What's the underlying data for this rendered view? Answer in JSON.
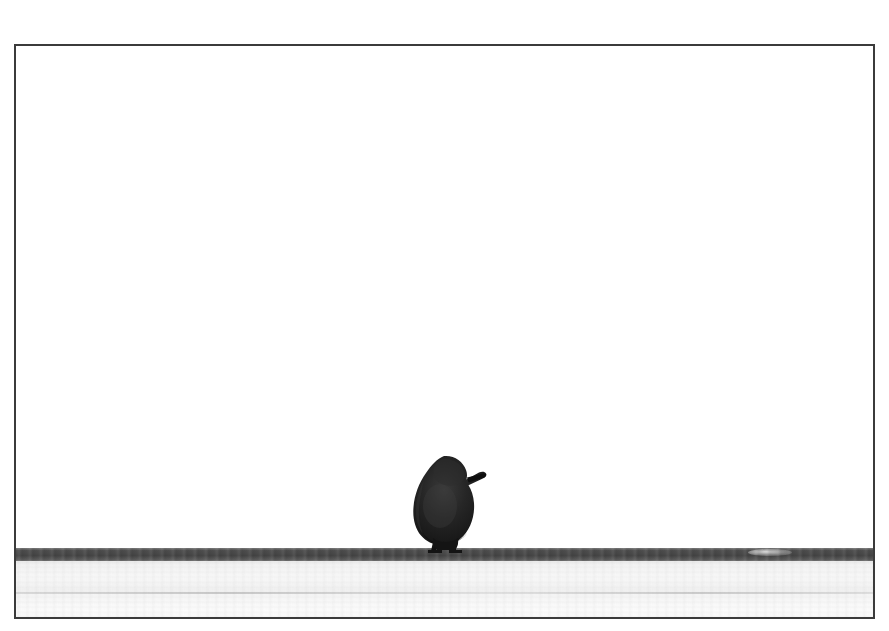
{
  "page": {
    "background_color": "#ffffff",
    "width": 889,
    "height": 631,
    "caption": ""
  },
  "photograph": {
    "title": "Bird perched on ledge",
    "alt_text": "Minimalist black and white photograph of a small dark bird silhouette perched on a pale concrete ledge against an empty white sky",
    "style": "black-and-white minimalist photograph",
    "frame": {
      "border_color": "#3b3b3b",
      "border_width_px": 2,
      "left": 14,
      "top": 44,
      "width": 861,
      "height": 575
    },
    "regions": [
      {
        "name": "sky",
        "description": "Empty blown-out white sky occupying the upper four fifths of the frame",
        "color": "#ffffff",
        "height_px": 504
      },
      {
        "name": "ledge-edge",
        "description": "Dark grey horizontal band forming the front lip of the ledge",
        "color": "#4a4a4a",
        "top_px": 502,
        "height_px": 14
      },
      {
        "name": "ledge-top",
        "description": "Pale light grey textured concrete surface of the ledge below the dark lip",
        "color": "#f4f4f4",
        "top_px": 516,
        "height_px": 59
      }
    ],
    "subject": {
      "name": "bird",
      "species_look": "sparrow",
      "silhouette_color": "#1a1a1a",
      "facing": "right",
      "position": {
        "left": 398,
        "top": 448,
        "width": 96,
        "height": 104
      },
      "details": [
        "rounded fluffed body",
        "short pointed beak aimed right",
        "small feet gripping the ledge lip",
        "soft downy contour along the back"
      ]
    }
  },
  "colors": {
    "sky_white": "#ffffff",
    "frame_border": "#3b3b3b",
    "ledge_dark_band": "#4a4a4a",
    "ledge_light": "#f4f4f4",
    "bird_silhouette": "#1a1a1a",
    "ledge_seam": "#a0a0a0"
  }
}
